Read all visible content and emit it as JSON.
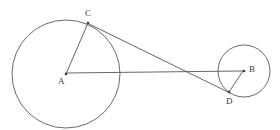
{
  "figure": {
    "type": "geometry-diagram",
    "width": 280,
    "height": 130,
    "background_color": "#ffffff",
    "stroke_color": "#555555",
    "label_color": "#3a3a3a"
  },
  "chart_data": {
    "type": "scatter",
    "title": "",
    "xlabel": "",
    "ylabel": "",
    "xlim": [
      0,
      280
    ],
    "ylim": [
      130,
      0
    ],
    "grid": false,
    "legend": "none",
    "circles": [
      {
        "name": "large-circle",
        "center_label": "A",
        "cx": 66,
        "cy": 74,
        "r": 54,
        "stroke": "#5a5a5a"
      },
      {
        "name": "small-circle",
        "center_label": "B",
        "cx": 244,
        "cy": 71,
        "r": 26,
        "stroke": "#5a5a5a"
      }
    ],
    "points": [
      {
        "label": "A",
        "x": 66,
        "y": 74,
        "label_x": 58,
        "label_y": 77,
        "role": "center-large-circle"
      },
      {
        "label": "B",
        "x": 244,
        "y": 71,
        "label_x": 249,
        "label_y": 65,
        "role": "center-small-circle"
      },
      {
        "label": "C",
        "x": 88,
        "y": 23,
        "label_x": 85,
        "label_y": 9,
        "role": "tangent-point-large-circle"
      },
      {
        "label": "D",
        "x": 229,
        "y": 92,
        "label_x": 226,
        "label_y": 97,
        "role": "tangent-point-small-circle"
      }
    ],
    "segments": [
      {
        "name": "segment-AC",
        "from": "A",
        "to": "C",
        "x1": 66,
        "y1": 74,
        "x2": 88,
        "y2": 23
      },
      {
        "name": "segment-AB",
        "from": "A",
        "to": "B",
        "x1": 66,
        "y1": 73,
        "x2": 243,
        "y2": 71
      },
      {
        "name": "segment-CD",
        "from": "C",
        "to": "D",
        "x1": 89,
        "y1": 24,
        "x2": 230,
        "y2": 93
      },
      {
        "name": "segment-BD",
        "from": "B",
        "to": "D",
        "x1": 243,
        "y1": 71,
        "x2": 229,
        "y2": 92
      }
    ],
    "intersections": [
      {
        "name": "CD-crosses-AB",
        "x": 195,
        "y": 72
      }
    ],
    "labels": [
      "A",
      "B",
      "C",
      "D"
    ]
  }
}
